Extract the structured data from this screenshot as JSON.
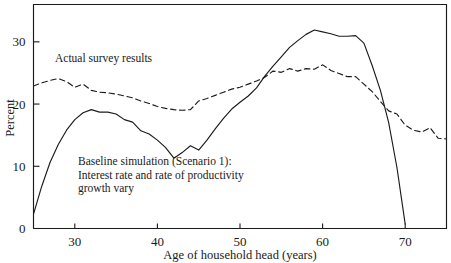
{
  "chart_data": {
    "type": "line",
    "title": "",
    "subtitle": "",
    "xlabel": "Age of household head (years)",
    "ylabel": "Percent",
    "xlim": [
      25,
      75
    ],
    "ylim": [
      0,
      36
    ],
    "xticks": [
      30,
      40,
      50,
      60,
      70
    ],
    "xtick_labels": [
      "30",
      "40",
      "50",
      "60",
      "70"
    ],
    "yticks": [
      0,
      10,
      20,
      30
    ],
    "ytick_labels": [
      "0",
      "10",
      "20",
      "30"
    ],
    "grid": false,
    "legend_position": "inline-annotations",
    "series": [
      {
        "name": "Actual survey results",
        "style": "dashed",
        "color": "#1c1c1c",
        "x": [
          25,
          26,
          27,
          28,
          29,
          30,
          31,
          32,
          33,
          34,
          35,
          36,
          37,
          38,
          39,
          40,
          41,
          42,
          43,
          44,
          45,
          46,
          47,
          48,
          49,
          50,
          51,
          52,
          53,
          54,
          55,
          56,
          57,
          58,
          59,
          60,
          61,
          62,
          63,
          64,
          65,
          66,
          67,
          68,
          69,
          70,
          71,
          72,
          73,
          74,
          75
        ],
        "values": [
          22.9,
          23.4,
          23.8,
          24.1,
          23.6,
          22.7,
          23.2,
          22.2,
          21.9,
          21.8,
          21.6,
          21.3,
          21.0,
          20.5,
          20.1,
          19.6,
          19.3,
          19.1,
          19.0,
          19.1,
          20.5,
          20.9,
          21.4,
          21.9,
          22.4,
          22.7,
          23.2,
          23.7,
          24.3,
          25.3,
          25.1,
          25.7,
          25.3,
          25.7,
          25.6,
          26.3,
          25.4,
          24.9,
          24.4,
          24.4,
          23.2,
          22.0,
          20.4,
          18.9,
          18.4,
          16.6,
          15.8,
          15.5,
          16.2,
          14.5,
          14.4
        ]
      },
      {
        "name": "Baseline simulation (Scenario 1)",
        "style": "solid",
        "color": "#1c1c1c",
        "x": [
          25,
          26,
          27,
          28,
          29,
          30,
          31,
          32,
          33,
          34,
          35,
          36,
          37,
          38,
          39,
          40,
          41,
          42,
          43,
          44,
          45,
          46,
          47,
          48,
          49,
          50,
          51,
          52,
          53,
          54,
          55,
          56,
          57,
          58,
          59,
          60,
          61,
          62,
          63,
          64,
          65,
          66,
          67,
          68,
          69,
          70
        ],
        "values": [
          2.3,
          6.8,
          10.6,
          13.5,
          15.8,
          17.5,
          18.6,
          19.1,
          18.7,
          18.7,
          18.4,
          17.5,
          17.1,
          15.7,
          15.2,
          14.2,
          13.0,
          11.3,
          12.2,
          13.3,
          12.6,
          14.2,
          16.0,
          17.7,
          19.2,
          20.3,
          21.3,
          22.6,
          24.5,
          26.1,
          27.6,
          29.1,
          30.2,
          31.2,
          31.9,
          31.6,
          31.3,
          30.9,
          30.9,
          31.0,
          29.8,
          26.2,
          22.2,
          17.0,
          9.8,
          0.7
        ]
      }
    ],
    "annotations": [
      {
        "id": "survey-annotation",
        "text_lines": [
          "Actual survey results"
        ],
        "x_px": 55,
        "y_px": 62
      },
      {
        "id": "baseline-annotation",
        "text_lines": [
          "Baseline simulation (Scenario 1):",
          "Interest rate and rate of productivity",
          "growth vary"
        ],
        "x_px": 78,
        "y_px": 165
      }
    ]
  },
  "axes": {
    "x_title": "Age of household head (years)",
    "y_title": "Percent"
  }
}
